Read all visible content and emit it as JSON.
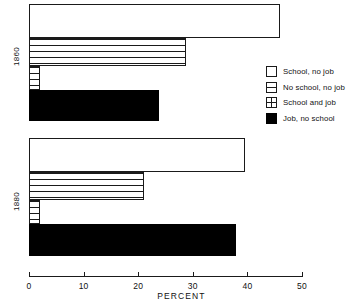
{
  "chart_data": {
    "type": "bar",
    "orientation": "horizontal",
    "title": "",
    "xlabel": "PERCENT",
    "ylabel": "",
    "xlim": [
      0,
      50
    ],
    "xticks": [
      0,
      10,
      20,
      30,
      40,
      50
    ],
    "xtick_labels": [
      "0",
      "10",
      "20",
      "30",
      "40",
      "50"
    ],
    "grid": false,
    "legend_position": "right",
    "categories": [
      "1860",
      "1880"
    ],
    "series": [
      {
        "name": "School, no job",
        "pattern": "open",
        "color": "#ffffff",
        "values": [
          46.0,
          39.5
        ]
      },
      {
        "name": "No school, no job",
        "pattern": "hlines",
        "color": "#ffffff",
        "values": [
          28.7,
          21.0
        ]
      },
      {
        "name": "School and job",
        "pattern": "grid",
        "color": "#ffffff",
        "values": [
          2.0,
          2.0
        ]
      },
      {
        "name": "Job, no school",
        "pattern": "solid",
        "color": "#000000",
        "values": [
          23.8,
          38.0
        ]
      }
    ]
  },
  "axis": {
    "x_title": "PERCENT",
    "ticks": [
      {
        "value": 0,
        "label": "0"
      },
      {
        "value": 10,
        "label": "10"
      },
      {
        "value": 20,
        "label": "20"
      },
      {
        "value": 30,
        "label": "30"
      },
      {
        "value": 40,
        "label": "40"
      },
      {
        "value": 50,
        "label": "50"
      }
    ]
  },
  "groups": [
    {
      "id": "1860",
      "label": "1860"
    },
    {
      "id": "1880",
      "label": "1880"
    }
  ],
  "legend": {
    "items": [
      {
        "label": "School, no job",
        "swatch": "open-square-icon"
      },
      {
        "label": "No school, no job",
        "swatch": "hlines-square-icon"
      },
      {
        "label": "School and job",
        "swatch": "grid-square-icon"
      },
      {
        "label": "Job, no school",
        "swatch": "solid-square-icon"
      }
    ]
  },
  "colors": {
    "ink": "#1a1a1a",
    "fill_solid": "#000000",
    "background": "#ffffff"
  }
}
